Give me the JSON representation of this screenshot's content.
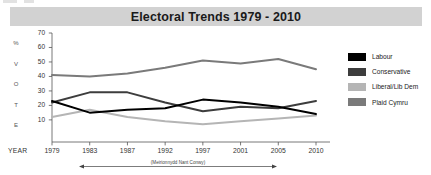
{
  "title": "Electoral Trends 1979 - 2010",
  "axis": {
    "y_caption_letters": [
      "%",
      "V",
      "O",
      "T",
      "E"
    ],
    "x_caption": "YEAR"
  },
  "footnote": "(Meirionnydd Nant Conwy)",
  "legend": {
    "items": [
      {
        "label": "Labour",
        "color": "#000000"
      },
      {
        "label": "Conservative",
        "color": "#3d3d3d"
      },
      {
        "label": "Liberal/Lib Dem",
        "color": "#b5b5b5"
      },
      {
        "label": "Plaid Cymru",
        "color": "#7a7a7a"
      }
    ]
  },
  "chart_data": {
    "type": "line",
    "title": "Electoral Trends 1979 - 2010",
    "xlabel": "YEAR",
    "ylabel": "% VOTE",
    "categories": [
      "1979",
      "1983",
      "1987",
      "1992",
      "1997",
      "2001",
      "2005",
      "2010"
    ],
    "x": [
      1979,
      1983,
      1987,
      1992,
      1997,
      2001,
      2005,
      2010
    ],
    "ylim": [
      0,
      70
    ],
    "yticks": [
      10,
      20,
      30,
      40,
      50,
      60,
      70
    ],
    "grid": false,
    "legend_position": "right",
    "annotation": "(Meirionnydd Nant Conwy)",
    "series": [
      {
        "name": "Labour",
        "color": "#000000",
        "values": [
          23,
          15,
          17,
          18,
          24,
          22,
          19,
          14
        ]
      },
      {
        "name": "Conservative",
        "color": "#3d3d3d",
        "values": [
          22,
          29,
          29,
          22,
          16,
          19,
          18,
          23
        ]
      },
      {
        "name": "Liberal/Lib Dem",
        "color": "#b5b5b5",
        "values": [
          12,
          17,
          12,
          9,
          7,
          9,
          11,
          13
        ]
      },
      {
        "name": "Plaid Cymru",
        "color": "#7a7a7a",
        "values": [
          41,
          40,
          42,
          46,
          51,
          49,
          52,
          45
        ]
      }
    ]
  }
}
